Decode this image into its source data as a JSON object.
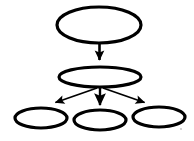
{
  "diagram": {
    "type": "directed-graph",
    "orientation": "top-down",
    "canvas": {
      "width": 194,
      "height": 141
    },
    "background_color": "#ffffff",
    "stroke_color": "#000000",
    "node_fill_color": "#ffffff",
    "node_shape": "ellipse",
    "node_count": 5,
    "edge_count": 4,
    "nodes": [
      {
        "id": "root",
        "label": "",
        "shape": "ellipse",
        "cx": 99,
        "cy": 25,
        "rx": 42,
        "ry": 18,
        "stroke_width": 3.2,
        "level": 0
      },
      {
        "id": "mid",
        "label": "",
        "shape": "ellipse",
        "cx": 100,
        "cy": 77,
        "rx": 41,
        "ry": 10,
        "stroke_width": 3.2,
        "level": 1
      },
      {
        "id": "leaf-left",
        "label": "",
        "shape": "ellipse",
        "cx": 41,
        "cy": 118,
        "rx": 26,
        "ry": 10,
        "stroke_width": 3.2,
        "level": 2
      },
      {
        "id": "leaf-center",
        "label": "",
        "shape": "ellipse",
        "cx": 100,
        "cy": 120,
        "rx": 26,
        "ry": 10,
        "stroke_width": 3.2,
        "level": 2
      },
      {
        "id": "leaf-right",
        "label": "",
        "shape": "ellipse",
        "cx": 159,
        "cy": 117,
        "rx": 26,
        "ry": 10,
        "stroke_width": 3.2,
        "level": 2
      }
    ],
    "edges": [
      {
        "id": "edge-root-mid",
        "from": "root",
        "to": "mid",
        "x1": 99.5,
        "y1": 43,
        "x2": 99.5,
        "y2": 60,
        "stroke_width": 2.6,
        "arrowhead": "solid-triangle",
        "arrow_size": 8
      },
      {
        "id": "edge-mid-leaf-left",
        "from": "mid",
        "to": "leaf-left",
        "x1": 97,
        "y1": 88,
        "x2": 54,
        "y2": 103,
        "stroke_width": 1.8,
        "arrowhead": "solid-triangle",
        "arrow_size": 8
      },
      {
        "id": "edge-mid-leaf-center",
        "from": "mid",
        "to": "leaf-center",
        "x1": 100,
        "y1": 88,
        "x2": 100,
        "y2": 106,
        "stroke_width": 2.4,
        "arrowhead": "solid-triangle",
        "arrow_size": 8
      },
      {
        "id": "edge-mid-leaf-right",
        "from": "mid",
        "to": "leaf-right",
        "x1": 103,
        "y1": 88,
        "x2": 146,
        "y2": 103,
        "stroke_width": 1.8,
        "arrowhead": "solid-triangle",
        "arrow_size": 8
      }
    ],
    "artifacts": [
      {
        "id": "speck-bottom-right",
        "cx": 181,
        "cy": 129,
        "r": 1.1,
        "color": "#c8c8c8"
      }
    ]
  }
}
